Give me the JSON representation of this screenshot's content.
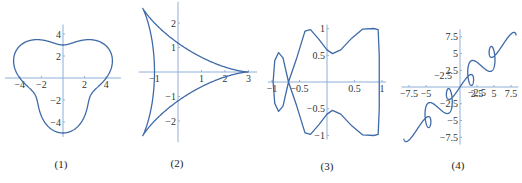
{
  "colors": {
    "axis": "#8fb0d8",
    "curve": "#3f6aa8",
    "text": "#333333"
  },
  "captions": [
    "(1)",
    "(2)",
    "(3)",
    "(4)"
  ],
  "chart_data": [
    {
      "type": "line",
      "title": "(1)",
      "curve": "polar r = 4 + sin(3θ)",
      "origin_px": [
        63,
        78
      ],
      "scale_px": [
        10.8,
        11.0
      ],
      "xlim": [
        -5,
        5
      ],
      "ylim": [
        -5,
        4.5
      ],
      "xticks": [
        -4,
        -2,
        2,
        4
      ],
      "xtick_labels": [
        "-4",
        "-2",
        "2",
        "4"
      ],
      "yticks": [
        -4,
        -2,
        2,
        4
      ],
      "ytick_labels": [
        "-4",
        "-2",
        "2",
        "4"
      ],
      "grid": false
    },
    {
      "type": "line",
      "title": "(2)",
      "curve": "x = 2cos t + cos 2t, y = 2sin t - sin 2t",
      "origin_px": [
        178,
        72
      ],
      "scale_px": [
        23.5,
        24.5
      ],
      "xlim": [
        -1.5,
        3.2
      ],
      "ylim": [
        -2.7,
        2.7
      ],
      "xticks": [
        -1,
        1,
        2,
        3
      ],
      "xtick_labels": [
        "-1",
        "1",
        "2",
        "3"
      ],
      "yticks": [
        -2,
        -1,
        1,
        2
      ],
      "ytick_labels": [
        "-2",
        "-1",
        "1",
        "2"
      ],
      "grid": false
    },
    {
      "type": "line",
      "title": "(3)",
      "curve": "closed self-intersecting curve, x in [-1,1], y in [-1,1]",
      "origin_px": [
        327,
        82
      ],
      "scale_px": [
        55,
        53.5
      ],
      "xlim": [
        -1,
        1
      ],
      "ylim": [
        -1,
        1
      ],
      "xticks": [
        -1,
        -0.5,
        0.5,
        1
      ],
      "xtick_labels": [
        "-1",
        "-0.5",
        "0.5",
        "1"
      ],
      "yticks": [
        -1,
        -0.5,
        0.5,
        1
      ],
      "ytick_labels": [
        "-1",
        "-0.5",
        "0.5",
        "1"
      ],
      "points": [
        [
          -0.7,
          0
        ],
        [
          -0.55,
          0.45
        ],
        [
          -0.4,
          0.95
        ],
        [
          -0.3,
          0.98
        ],
        [
          -0.15,
          0.8
        ],
        [
          0,
          0.6
        ],
        [
          0.1,
          0.53
        ],
        [
          0.25,
          0.6
        ],
        [
          0.45,
          0.82
        ],
        [
          0.65,
          0.99
        ],
        [
          0.85,
          1.0
        ],
        [
          0.93,
          0.98
        ],
        [
          0.95,
          0.5
        ],
        [
          0.95,
          -0.5
        ],
        [
          0.93,
          -0.98
        ],
        [
          0.85,
          -1.0
        ],
        [
          0.65,
          -0.99
        ],
        [
          0.45,
          -0.82
        ],
        [
          0.25,
          -0.6
        ],
        [
          0.1,
          -0.53
        ],
        [
          0,
          -0.6
        ],
        [
          -0.15,
          -0.8
        ],
        [
          -0.3,
          -0.98
        ],
        [
          -0.4,
          -0.95
        ],
        [
          -0.55,
          -0.45
        ],
        [
          -0.7,
          0
        ],
        [
          -0.8,
          0.45
        ],
        [
          -0.88,
          0.55
        ],
        [
          -0.95,
          0.4
        ],
        [
          -0.98,
          0
        ],
        [
          -0.95,
          -0.4
        ],
        [
          -0.88,
          -0.55
        ],
        [
          -0.8,
          -0.45
        ],
        [
          -0.7,
          0
        ]
      ],
      "grid": false
    },
    {
      "type": "line",
      "title": "(4)",
      "curve": "x = t + sin 2t, y = t + sin 3t (approx.)",
      "origin_px": [
        460,
        87
      ],
      "scale_px": [
        6.8,
        6.7
      ],
      "xlim": [
        -8,
        8
      ],
      "ylim": [
        -8,
        8
      ],
      "xticks": [
        -7.5,
        -5,
        2.5,
        5,
        7.5
      ],
      "xtick_labels": [
        "-7.5",
        "-5",
        "2.5",
        "5",
        "7.5"
      ],
      "yticks": [
        7.5,
        5,
        2.5,
        -2.5,
        -5,
        -7.5
      ],
      "ytick_labels": [
        "7.5",
        "5",
        "2.5",
        "-2.5",
        "-5",
        "-7.5"
      ],
      "extra_labels": [
        {
          "x": -2.5,
          "y": 1.2,
          "text": "-2.5"
        },
        {
          "x": 2.5,
          "y": -1.3,
          "text": "-2.5"
        }
      ],
      "grid": false
    }
  ]
}
